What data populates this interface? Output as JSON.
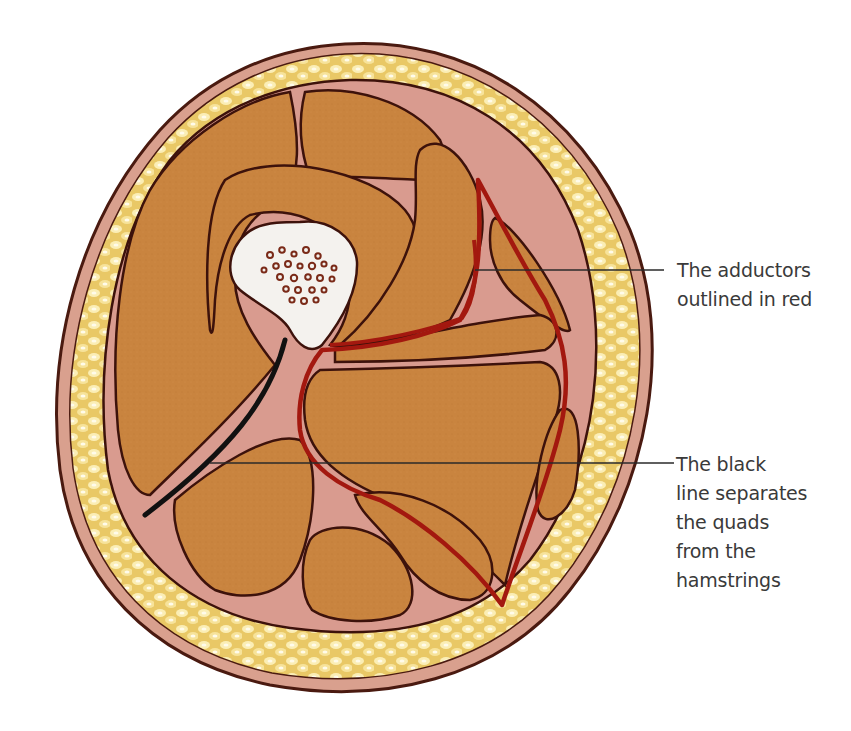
{
  "diagram": {
    "structures": [
      "skin",
      "subcutaneous fat",
      "fascia",
      "muscle compartments",
      "femur (bone with marrow)",
      "adductor outline",
      "quad/hamstring separating septum"
    ],
    "colors": {
      "background": "#ffffff",
      "skin_outline": "#4a1a10",
      "skin_fill": "#d9a08e",
      "fat": "#f0d580",
      "fat_highlight": "#fff6d6",
      "fascia": "#d99b8f",
      "muscle": "#c9843f",
      "muscle_outline": "#3d120b",
      "bone": "#f4f2ee",
      "marrow_spots": "#7a2a18",
      "adductor_outline": "#a3180f",
      "septum_black": "#111111",
      "leader_line": "#2a2a2a",
      "label_text": "#3a3a3a"
    }
  },
  "callouts": [
    {
      "id": "adductors",
      "lines": [
        "The adductors",
        "outlined in red"
      ]
    },
    {
      "id": "black-line",
      "lines": [
        "The black",
        "line separates",
        "the quads",
        "from the",
        "hamstrings"
      ]
    }
  ]
}
